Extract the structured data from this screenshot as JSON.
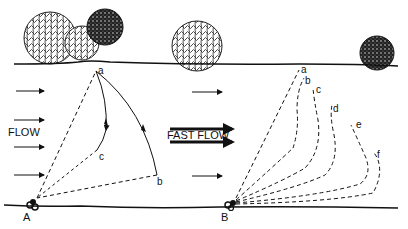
{
  "labels": {
    "flow": "FLOW",
    "fast_flow": "FAST FLOW",
    "anchor_a": "A",
    "anchor_b": "B",
    "left_points": [
      "a",
      "b",
      "c"
    ],
    "right_points": [
      "a",
      "b",
      "c",
      "d",
      "e",
      "f"
    ]
  },
  "colors": {
    "ink": "#111111",
    "background": "#ffffff"
  }
}
